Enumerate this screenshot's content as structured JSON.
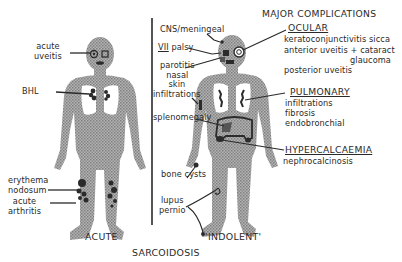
{
  "title": "SARCOIDOSIS",
  "panels": {
    "acute": {
      "label": "ACUTE",
      "annotations": {
        "uveitis": [
          "acute",
          "uveitis"
        ],
        "bhl": "BHL",
        "erythema": [
          "erythema",
          "nodosum"
        ],
        "arthritis": [
          "acute",
          "arthritis"
        ]
      }
    },
    "indolent": {
      "label": "'INDOLENT'",
      "annotations": {
        "cns": "CNS/meningeal",
        "vii_numeral": "VII",
        "vii_rest": "palsy",
        "parotitis": [
          "parotitis",
          "nasal"
        ],
        "skin": [
          "skin",
          "infiltrations"
        ],
        "spleen": "splenomegaly",
        "bone": "bone cysts",
        "lupus": [
          "lupus",
          "pernio"
        ]
      }
    }
  },
  "major_complications": {
    "heading": "MAJOR COMPLICATIONS",
    "groups": [
      {
        "name": "OCULAR",
        "items": [
          "keratoconjunctivitis  sicca",
          "anterior uveitis + cataract",
          "glaucoma",
          "posterior uveitis"
        ]
      },
      {
        "name": "PULMONARY",
        "items": [
          "infiltrations",
          "fibrosis",
          "endobronchial"
        ]
      },
      {
        "name": "HYPERCALCAEMIA",
        "items": [
          "nephrocalcinosis"
        ]
      }
    ]
  },
  "colors": {
    "figure_fill": "#9a9a9a",
    "lesion": "#2b2b2b",
    "line": "#2a2a2a",
    "background": "#ffffff"
  }
}
